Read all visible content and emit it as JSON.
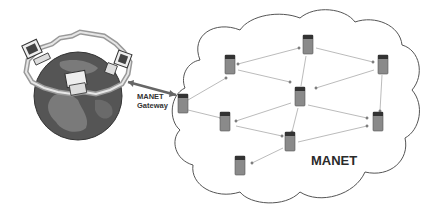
{
  "diagram": {
    "type": "network-topology",
    "labels": {
      "gateway_line1": "MANET",
      "gateway_line2": "Gateway",
      "cloud": "MANET"
    },
    "nodes": [
      {
        "id": "gateway",
        "x": 183,
        "y": 105
      },
      {
        "id": "n-top",
        "x": 308,
        "y": 45
      },
      {
        "id": "n-topleft",
        "x": 230,
        "y": 65
      },
      {
        "id": "n-topright",
        "x": 383,
        "y": 65
      },
      {
        "id": "n-center",
        "x": 300,
        "y": 97
      },
      {
        "id": "n-midleft",
        "x": 225,
        "y": 122
      },
      {
        "id": "n-midright",
        "x": 378,
        "y": 127
      },
      {
        "id": "n-lowcenter",
        "x": 290,
        "y": 140
      },
      {
        "id": "n-bottomleft",
        "x": 240,
        "y": 165
      }
    ],
    "edges": [
      [
        "gateway",
        "n-topleft"
      ],
      [
        "gateway",
        "n-midleft"
      ],
      [
        "n-topleft",
        "n-top"
      ],
      [
        "n-topleft",
        "n-center"
      ],
      [
        "n-top",
        "n-topright"
      ],
      [
        "n-top",
        "n-center"
      ],
      [
        "n-topright",
        "n-center"
      ],
      [
        "n-topright",
        "n-midright"
      ],
      [
        "n-center",
        "n-midleft"
      ],
      [
        "n-center",
        "n-midright"
      ],
      [
        "n-center",
        "n-lowcenter"
      ],
      [
        "n-midleft",
        "n-lowcenter"
      ],
      [
        "n-lowcenter",
        "n-midright"
      ],
      [
        "n-lowcenter",
        "n-bottomleft"
      ]
    ],
    "colors": {
      "globe": "#555555",
      "land": "#7a7a7a",
      "cloud_stroke": "#555555",
      "edge": "#aaaaaa",
      "node": "#8a8a8a"
    }
  }
}
